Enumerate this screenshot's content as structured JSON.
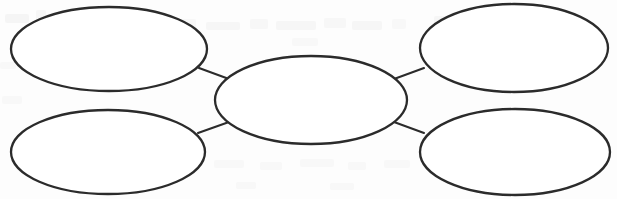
{
  "document": {
    "title": "Blank Web Graphic Organizer",
    "background_color": "#fdfdfd",
    "stroke_color": "#2b2b2b",
    "fill_color": "#ffffff",
    "ghost_color": "#efefef",
    "width": 617,
    "height": 199
  },
  "diagram": {
    "type": "concept-web",
    "node_count": 5,
    "connector_count": 4,
    "nodes": [
      {
        "id": "center-node",
        "role": "center",
        "label": "",
        "cx": 311,
        "cy": 100,
        "rx": 96,
        "ry": 44
      },
      {
        "id": "top-left-node",
        "role": "satellite",
        "label": "",
        "cx": 109,
        "cy": 49,
        "rx": 98,
        "ry": 42
      },
      {
        "id": "top-right-node",
        "role": "satellite",
        "label": "",
        "cx": 514,
        "cy": 48,
        "rx": 94,
        "ry": 44
      },
      {
        "id": "bottom-left-node",
        "role": "satellite",
        "label": "",
        "cx": 108,
        "cy": 152,
        "rx": 97,
        "ry": 42
      },
      {
        "id": "bottom-right-node",
        "role": "satellite",
        "label": "",
        "cx": 515,
        "cy": 152,
        "rx": 95,
        "ry": 43
      }
    ],
    "connectors": [
      {
        "id": "connector-top-left",
        "from": "top-left-node",
        "to": "center-node",
        "x1": 199,
        "y1": 68,
        "x2": 229,
        "y2": 79
      },
      {
        "id": "connector-top-right",
        "from": "center-node",
        "to": "top-right-node",
        "x1": 394,
        "y1": 79,
        "x2": 424,
        "y2": 68
      },
      {
        "id": "connector-bottom-left",
        "from": "bottom-left-node",
        "to": "center-node",
        "x1": 198,
        "y1": 133,
        "x2": 229,
        "y2": 122
      },
      {
        "id": "connector-bottom-right",
        "from": "center-node",
        "to": "bottom-right-node",
        "x1": 394,
        "y1": 122,
        "x2": 424,
        "y2": 133
      }
    ],
    "ghost_marks": [
      {
        "x": 5,
        "y": 14,
        "w": 24,
        "h": 9,
        "opacity": 0.55
      },
      {
        "x": 36,
        "y": 10,
        "w": 10,
        "h": 12,
        "opacity": 0.5
      },
      {
        "x": 60,
        "y": 22,
        "w": 30,
        "h": 8,
        "opacity": 0.45
      },
      {
        "x": 108,
        "y": 20,
        "w": 46,
        "h": 9,
        "opacity": 0.5
      },
      {
        "x": 168,
        "y": 19,
        "w": 28,
        "h": 9,
        "opacity": 0.45
      },
      {
        "x": 206,
        "y": 22,
        "w": 34,
        "h": 8,
        "opacity": 0.5
      },
      {
        "x": 250,
        "y": 19,
        "w": 18,
        "h": 10,
        "opacity": 0.45
      },
      {
        "x": 276,
        "y": 21,
        "w": 40,
        "h": 9,
        "opacity": 0.5
      },
      {
        "x": 324,
        "y": 18,
        "w": 22,
        "h": 10,
        "opacity": 0.45
      },
      {
        "x": 352,
        "y": 21,
        "w": 30,
        "h": 9,
        "opacity": 0.5
      },
      {
        "x": 392,
        "y": 19,
        "w": 14,
        "h": 10,
        "opacity": 0.4
      },
      {
        "x": 434,
        "y": 16,
        "w": 38,
        "h": 9,
        "opacity": 0.5
      },
      {
        "x": 480,
        "y": 18,
        "w": 26,
        "h": 9,
        "opacity": 0.45
      },
      {
        "x": 514,
        "y": 15,
        "w": 34,
        "h": 9,
        "opacity": 0.5
      },
      {
        "x": 556,
        "y": 18,
        "w": 20,
        "h": 9,
        "opacity": 0.45
      },
      {
        "x": 292,
        "y": 38,
        "w": 26,
        "h": 8,
        "opacity": 0.4
      },
      {
        "x": 0,
        "y": 62,
        "w": 16,
        "h": 7,
        "opacity": 0.4
      },
      {
        "x": 2,
        "y": 96,
        "w": 20,
        "h": 8,
        "opacity": 0.4
      },
      {
        "x": 214,
        "y": 160,
        "w": 30,
        "h": 8,
        "opacity": 0.4
      },
      {
        "x": 260,
        "y": 162,
        "w": 22,
        "h": 8,
        "opacity": 0.35
      },
      {
        "x": 300,
        "y": 159,
        "w": 34,
        "h": 8,
        "opacity": 0.4
      },
      {
        "x": 348,
        "y": 162,
        "w": 18,
        "h": 8,
        "opacity": 0.35
      },
      {
        "x": 384,
        "y": 160,
        "w": 26,
        "h": 8,
        "opacity": 0.4
      },
      {
        "x": 236,
        "y": 182,
        "w": 20,
        "h": 7,
        "opacity": 0.35
      },
      {
        "x": 330,
        "y": 183,
        "w": 24,
        "h": 7,
        "opacity": 0.35
      }
    ]
  }
}
